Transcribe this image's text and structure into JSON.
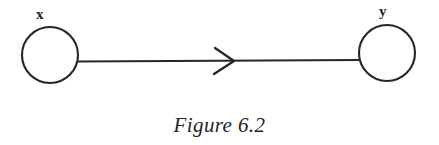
{
  "figure": {
    "caption": "Figure 6.2",
    "background_color": "#ffffff",
    "ink_color": "#262626"
  },
  "diagram": {
    "type": "directed-graph",
    "nodes": [
      {
        "id": "x",
        "label": "x",
        "shape": "circle",
        "cx": 50,
        "cy": 55,
        "r": 28,
        "label_position": "above"
      },
      {
        "id": "y",
        "label": "y",
        "shape": "circle",
        "cx": 387,
        "cy": 53,
        "r": 28,
        "label_position": "above"
      }
    ],
    "edges": [
      {
        "from": "x",
        "to": "y",
        "directed": true,
        "arrowhead_style": "open-chevron",
        "x1": 78,
        "y1": 61,
        "x2": 359,
        "y2": 60,
        "arrow_tip_x": 234
      }
    ]
  }
}
